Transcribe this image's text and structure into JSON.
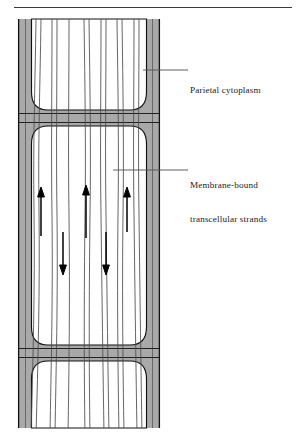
{
  "figure": {
    "domain": "biological-diagram",
    "title_rule": {
      "present": true,
      "color": "#333333"
    },
    "labels": [
      {
        "id": "parietal",
        "name": "parietal-cytoplasm-label",
        "lines": [
          "Parietal cytoplasm"
        ],
        "text": "Parietal cytoplasm",
        "x": 190,
        "y": 63,
        "leader": {
          "x1": 143,
          "y1": 70,
          "x2": 188,
          "y2": 70
        }
      },
      {
        "id": "strands",
        "name": "transcellular-strands-label",
        "lines": [
          "Membrane-bound",
          "transcellular strands"
        ],
        "text": "Membrane-bound transcellular strands",
        "x": 190,
        "y": 158,
        "leader": {
          "x1": 113,
          "y1": 170,
          "x2": 188,
          "y2": 170
        }
      }
    ],
    "colors": {
      "cytoplasm_gray": "#a9a9a9",
      "cytoplasm_gray_dark": "#9d9d9d",
      "outline": "#111111",
      "strand": "#555555",
      "vacuole_white": "#ffffff",
      "arrow": "#000000",
      "leader": "#555555",
      "rule": "#3a3a3a",
      "text": "#1a1a1a"
    },
    "cell": {
      "left": 18,
      "right": 160,
      "top": 19,
      "bottom": 428,
      "wall_thickness": 14,
      "junctions": [
        {
          "name": "upper-cross-wall",
          "y": 117
        },
        {
          "name": "lower-cross-wall",
          "y": 352
        }
      ]
    },
    "strands": {
      "count": 7,
      "description": "membrane-bound transcellular strands spanning the vacuole",
      "x_positions": [
        34,
        49,
        63,
        80,
        97,
        113,
        131
      ]
    },
    "arrows": [
      {
        "name": "arrow-up-1",
        "direction": "up",
        "x": 41,
        "y_tail": 236,
        "y_head": 190
      },
      {
        "name": "arrow-down-1",
        "direction": "down",
        "x": 63,
        "y_tail": 232,
        "y_head": 272
      },
      {
        "name": "arrow-up-2",
        "direction": "up",
        "x": 86,
        "y_tail": 238,
        "y_head": 188
      },
      {
        "name": "arrow-down-2",
        "direction": "down",
        "x": 106,
        "y_tail": 232,
        "y_head": 272
      },
      {
        "name": "arrow-up-3",
        "direction": "up",
        "x": 127,
        "y_tail": 232,
        "y_head": 190
      }
    ]
  }
}
